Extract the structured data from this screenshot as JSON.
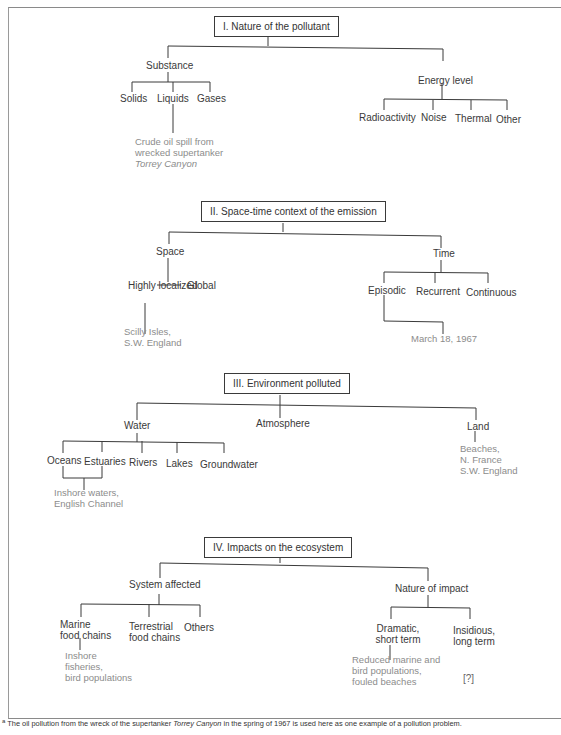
{
  "header_cut": "...graph of a problem",
  "sections": [
    {
      "title": "I. Nature of the pollutant",
      "branches": [
        {
          "label": "Substance",
          "children": [
            "Solids",
            "Liquids",
            "Gases"
          ],
          "example": [
            "Crude oil spill from",
            "wrecked supertanker",
            "Torrey Canyon"
          ]
        },
        {
          "label": "Energy level",
          "children": [
            "Radioactivity",
            "Noise",
            "Thermal",
            "Other"
          ]
        }
      ]
    },
    {
      "title": "II. Space-time context of the emission",
      "branches": [
        {
          "label": "Space",
          "children": [
            "Highly localized",
            "Global"
          ],
          "example": [
            "Scilly Isles,",
            "S.W. England"
          ]
        },
        {
          "label": "Time",
          "children": [
            "Episodic",
            "Recurrent",
            "Continuous"
          ],
          "example": [
            "March 18, 1967"
          ]
        }
      ]
    },
    {
      "title": "III. Environment polluted",
      "branches": [
        {
          "label": "Water",
          "children": [
            "Oceans",
            "Estuaries",
            "Rivers",
            "Lakes",
            "Groundwater"
          ],
          "example": [
            "Inshore waters,",
            "English Channel"
          ]
        },
        {
          "label": "Atmosphere"
        },
        {
          "label": "Land",
          "example": [
            "Beaches,",
            "N. France",
            "S.W. England"
          ]
        }
      ]
    },
    {
      "title": "IV. Impacts on the ecosystem",
      "branches": [
        {
          "label": "System affected",
          "children": [
            "Marine food chains",
            "Terrestrial food chains",
            "Others"
          ],
          "example": [
            "Inshore",
            "fisheries,",
            "bird populations"
          ]
        },
        {
          "label": "Nature of impact",
          "children": [
            "Dramatic, short term",
            "Insidious, long term"
          ],
          "example": [
            "Reduced marine and",
            "bird populations,",
            "fouled beaches"
          ],
          "unknown": "[?]"
        }
      ]
    }
  ],
  "footnote": {
    "marker": "a",
    "pre": "The oil pollution from the wreck of the supertanker ",
    "italic": "Torrey Canyon",
    "post": " in the spring of 1967 is used here as one example of a pollution problem."
  }
}
